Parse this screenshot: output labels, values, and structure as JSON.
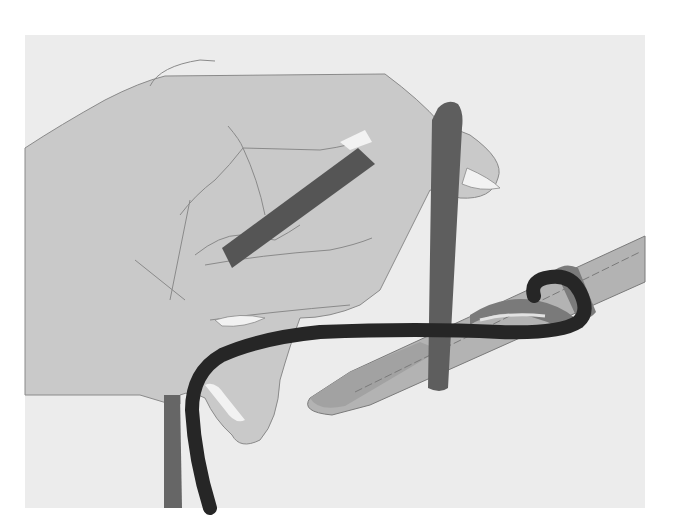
{
  "figure": {
    "kind": "instructional-illustration",
    "frame": {
      "x": 25,
      "y": 35,
      "width": 620,
      "height": 473
    },
    "colors": {
      "page": "#ffffff",
      "frame_bg": "#ececec",
      "hand_fill": "#c9c9c9",
      "hand_outline": "#8a8a8a",
      "fingernail": "#f2f2f2",
      "needle_fill": "#b3b3b3",
      "needle_tip": "#a2a2a2",
      "needle_collar": "#7b7b7b",
      "strand_gray": "#666666",
      "strand_dark_gray": "#505050",
      "working_yarn": "#262626"
    },
    "elements": [
      {
        "name": "hand",
        "label": "Hand"
      },
      {
        "name": "knitting-needle",
        "label": "Needle"
      },
      {
        "name": "vertical-strand",
        "label": "Strand over finger"
      },
      {
        "name": "diagonal-strand",
        "label": "Strand inside palm"
      },
      {
        "name": "working-yarn",
        "label": "Working yarn"
      },
      {
        "name": "loop-on-needle",
        "label": "Loop on needle"
      }
    ]
  }
}
